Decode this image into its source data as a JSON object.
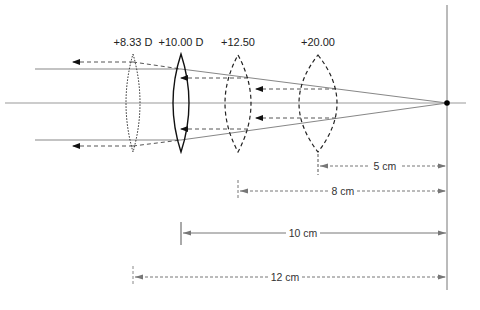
{
  "figure": {
    "lenses": [
      {
        "id": "lens-8-33",
        "label": "+8.33 D",
        "x": 133,
        "halfwidth": 7,
        "style": "dotted"
      },
      {
        "id": "lens-10-00",
        "label": "+10.00 D",
        "x": 181,
        "halfwidth": 8,
        "style": "solid"
      },
      {
        "id": "lens-12-50",
        "label": "+12.50",
        "x": 238,
        "halfwidth": 13,
        "style": "dashed"
      },
      {
        "id": "lens-20-00",
        "label": "+20.00",
        "x": 318,
        "halfwidth": 19,
        "style": "dashed"
      }
    ],
    "dimensions": [
      {
        "label": "5 cm",
        "from_x": 318,
        "to_x": 447,
        "y": 166,
        "style": "dashed"
      },
      {
        "label": "8 cm",
        "from_x": 238,
        "to_x": 447,
        "y": 191,
        "style": "dashed"
      },
      {
        "label": "10 cm",
        "from_x": 181,
        "to_x": 447,
        "y": 233,
        "style": "solid"
      },
      {
        "label": "12 cm",
        "from_x": 133,
        "to_x": 447,
        "y": 277,
        "style": "dashed"
      }
    ],
    "colors": {
      "ray": "#888888",
      "axis": "#999999",
      "lens": "#111111",
      "dim": "#666666",
      "focal_point": "#000000"
    }
  }
}
